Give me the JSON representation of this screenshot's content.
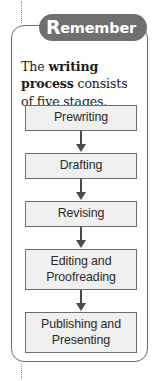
{
  "badge": {
    "initial": "R",
    "rest": "emember"
  },
  "intro": {
    "segments": [
      {
        "text": "The ",
        "bold": false
      },
      {
        "text": "writing process",
        "bold": true
      },
      {
        "text": " consists of five stages.",
        "bold": false
      }
    ],
    "full_text": "The writing process consists of five stages."
  },
  "flow": {
    "arrow_icon": "down-arrow-icon",
    "steps": [
      {
        "label": "Prewriting",
        "lines": [
          "Prewriting"
        ]
      },
      {
        "label": "Drafting",
        "lines": [
          "Drafting"
        ]
      },
      {
        "label": "Revising",
        "lines": [
          "Revising"
        ]
      },
      {
        "label": "Editing and Proofreading",
        "lines": [
          "Editing and",
          "Proofreading"
        ]
      },
      {
        "label": "Publishing and Presenting",
        "lines": [
          "Publishing and",
          "Presenting"
        ]
      }
    ]
  },
  "colors": {
    "badge_background": "#6f6f6f",
    "badge_text": "#ffffff",
    "panel_border": "#6d6d6d",
    "box_fill": "#f0f0f0",
    "box_border": "#6d6d6d",
    "arrow": "#4a4a4a",
    "body_text": "#1c1c1c",
    "guide_line": "#8d8d8d",
    "page_background": "#ffffff"
  }
}
